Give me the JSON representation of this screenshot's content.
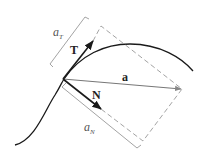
{
  "diagram": {
    "labels": {
      "tangent": "T",
      "normal": "N",
      "acceleration": "a",
      "a_T_base": "a",
      "a_T_sub": "T",
      "a_N_base": "a",
      "a_N_sub": "N"
    },
    "colors": {
      "curve": "#1a1a1a",
      "vectors": "#1a1a1a",
      "accel_vector": "#777777",
      "dashed": "#999999",
      "bracket": "#999999"
    }
  }
}
